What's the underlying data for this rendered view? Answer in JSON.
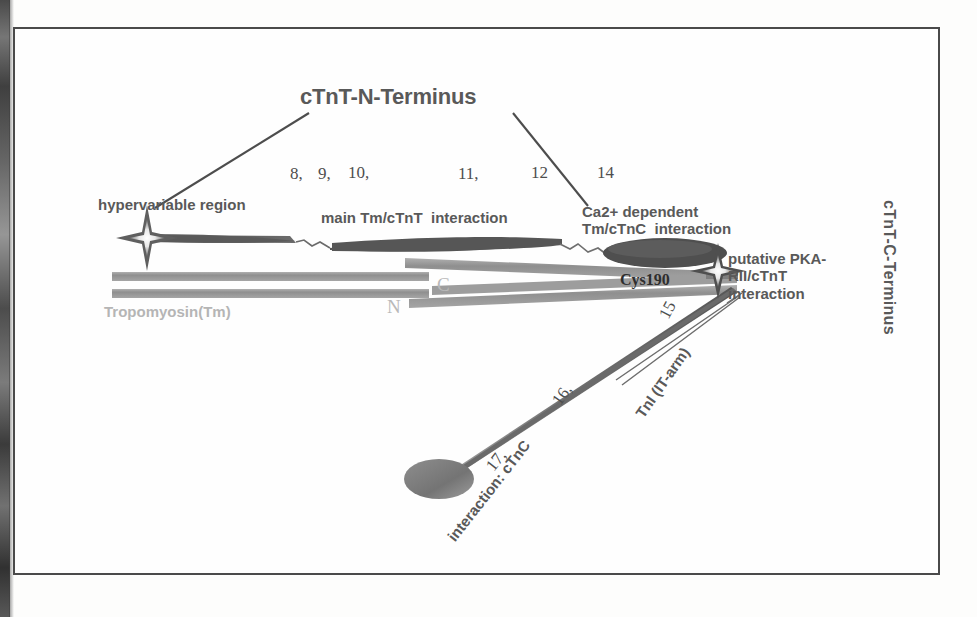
{
  "figure": {
    "title": "cTnT-N-Terminus",
    "right_axis_label": "cTnT-C-Terminus",
    "labels": {
      "hypervariable_region": "hypervariable region",
      "main_interaction": "main Tm/cTnT  interaction",
      "ca_dependent": "Ca2+ dependent\nTm/cTnC  interaction",
      "putative_pka": "putative PKA-\nRII/cTnT\ninteraction",
      "tropomyosin": "Tropomyosin(Tm)",
      "cys190": "Cys190",
      "terminus_c": "C",
      "terminus_n": "N",
      "tni_arm": "TnI (IT-arm)",
      "interaction_ctnc": "interaction: cTnC"
    },
    "reference_numbers": {
      "n8": "8,",
      "n9": "9,",
      "n10": "10,",
      "n11": "11,",
      "n12": "12",
      "n14": "14",
      "n15": "15",
      "n16": "16,",
      "n17": "17,"
    },
    "colors": {
      "frame": "#4a4a4a",
      "label_gray": "#5a5a5a",
      "light_gray": "#b5b5b5",
      "dark_shape": "#555555",
      "mid_shape": "#8a8a8a",
      "rod_gray": "#9a9a9a",
      "background": "#fefefe"
    },
    "shapes": {
      "star_left": "star-marker-hypervariable",
      "star_right": "star-marker-cys190",
      "ellipse_bottom": "ellipse-ctnc-domain",
      "tapered_bar_n": "tapered-bar-n-terminal",
      "tapered_bar_mid": "tapered-bar-mid",
      "tm_rod_upper": "tropomyosin-rod-upper",
      "tm_rod_lower": "tropomyosin-rod-lower",
      "it_arm_rod": "it-arm-tapered-rod",
      "leader_line_left": "leader-line-to-hypervariable",
      "leader_line_right": "leader-line-to-ca-dependent",
      "pointer_lines_pka": "pointer-lines-to-pka-site"
    }
  }
}
